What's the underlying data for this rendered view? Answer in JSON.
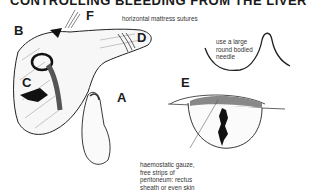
{
  "title": "CONTROLLING BLEEDING FROM THE LIVER",
  "labels": {
    "a": "A",
    "b": "B",
    "c": "C",
    "d": "D",
    "e": "E",
    "f": "F"
  },
  "annotations": {
    "sutures": "horizontal mattress sutures",
    "needle_1": "use a large",
    "needle_2": "round bodied",
    "needle_3": "needle",
    "gauze_1": "haemostatic gauze,",
    "gauze_2": "free strips of",
    "gauze_3": "peritoneum: rectus",
    "gauze_4": "sheath or even skin"
  }
}
